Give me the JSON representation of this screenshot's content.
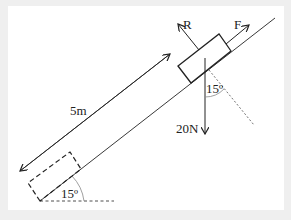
{
  "diagram": {
    "type": "inclined-plane-force-diagram",
    "labels": {
      "normal_force": "R",
      "applied_force": "F",
      "weight": "20N",
      "distance": "5m",
      "incline_angle": "15º",
      "weight_angle": "15º"
    },
    "colors": {
      "stroke": "#222222",
      "background": "#ffffff",
      "border": "#efefef",
      "arc": "#888888"
    }
  }
}
